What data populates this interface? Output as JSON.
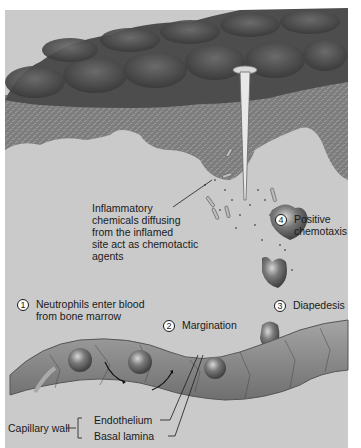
{
  "diagram": {
    "colors": {
      "background": "#c9c9c9",
      "skin_surface": "#5a5a5a",
      "dermis": "#8a8a8a",
      "capillary": "#8c8c8c",
      "text": "#1a1a1a"
    },
    "labels": {
      "step1": {
        "number": "1",
        "lines": [
          "Neutrophils enter blood",
          "from bone marrow"
        ]
      },
      "step2": {
        "number": "2",
        "text": "Margination"
      },
      "step3": {
        "number": "3",
        "text": "Diapedesis"
      },
      "step4": {
        "number": "4",
        "lines": [
          "Positive",
          "chemotaxis"
        ]
      },
      "chemicals": {
        "lines": [
          "Inflammatory",
          "chemicals diffusing",
          "from the inflamed",
          "site act as chemotactic",
          "agents"
        ]
      },
      "capillary_wall": "Capillary wall",
      "endothelium": "Endothelium",
      "basal_lamina": "Basal lamina"
    }
  }
}
